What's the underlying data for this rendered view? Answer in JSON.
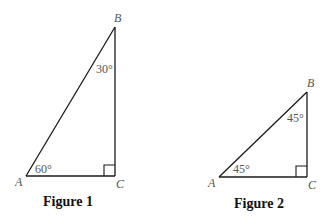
{
  "figures": [
    {
      "caption": "Figure 1",
      "vertices": {
        "A": "A",
        "B": "B",
        "C": "C"
      },
      "angles": {
        "A": "60°",
        "B": "30°",
        "C": "right angle"
      },
      "angle_labels": {
        "A": "60°",
        "B": "30°"
      }
    },
    {
      "caption": "Figure 2",
      "vertices": {
        "A": "A",
        "B": "B",
        "C": "C"
      },
      "angles": {
        "A": "45°",
        "B": "45°",
        "C": "right angle"
      },
      "angle_labels": {
        "A": "45°",
        "B": "45°"
      }
    }
  ],
  "colors": {
    "line": "#1a1a1a",
    "label": "#555555",
    "caption": "#111111"
  }
}
